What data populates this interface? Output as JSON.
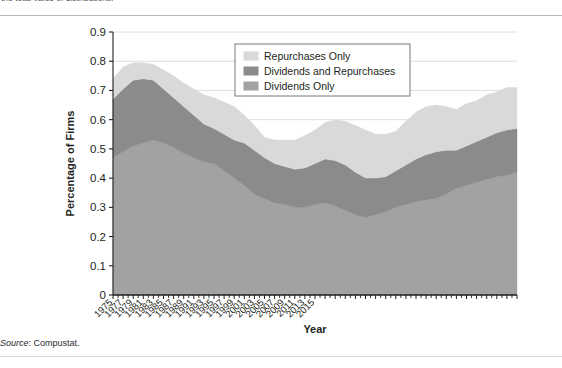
{
  "caption_fragment": "the total value of distributions.",
  "source_note": {
    "prefix": "Source",
    "text": ": Compustat."
  },
  "axis": {
    "ylabel": "Percentage of Firms",
    "xlabel": "Year",
    "yticks": [
      "0",
      "0.1",
      "0.2",
      "0.3",
      "0.4",
      "0.5",
      "0.6",
      "0.7",
      "0.8",
      "0.9"
    ],
    "xticks": [
      "1975",
      "1977",
      "1979",
      "1981",
      "1983",
      "1985",
      "1987",
      "1989",
      "1991",
      "1993",
      "1995",
      "1997",
      "1999",
      "2001",
      "2003",
      "2005",
      "2007",
      "2009",
      "2011",
      "2013",
      "2015"
    ]
  },
  "legend": {
    "items": [
      {
        "label": "Repurchases Only",
        "color": "#d9d9d9"
      },
      {
        "label": "Dividends and Repurchases",
        "color": "#8b8b8b"
      },
      {
        "label": "Dividends Only",
        "color": "#a2a2a2"
      }
    ]
  },
  "colors": {
    "repurchases_only": "#d9d9d9",
    "dividends_and_repurchases": "#8b8b8b",
    "dividends_only": "#a2a2a2",
    "axis": "#231f20",
    "grid": "#d5d5d7",
    "outline": "#bdbdbd"
  },
  "chart_data": {
    "type": "area",
    "stacked": true,
    "title": "",
    "xlabel": "Year",
    "ylabel": "Percentage of Firms",
    "xlim": [
      1975,
      2015
    ],
    "ylim": [
      0,
      0.9
    ],
    "grid": true,
    "legend_position": "top-center",
    "x": [
      1975,
      1976,
      1977,
      1978,
      1979,
      1980,
      1981,
      1982,
      1983,
      1984,
      1985,
      1986,
      1987,
      1988,
      1989,
      1990,
      1991,
      1992,
      1993,
      1994,
      1995,
      1996,
      1997,
      1998,
      1999,
      2000,
      2001,
      2002,
      2003,
      2004,
      2005,
      2006,
      2007,
      2008,
      2009,
      2010,
      2011,
      2012,
      2013,
      2014,
      2015
    ],
    "series": [
      {
        "name": "Dividends Only",
        "values": [
          0.47,
          0.49,
          0.51,
          0.52,
          0.53,
          0.52,
          0.505,
          0.485,
          0.47,
          0.455,
          0.45,
          0.425,
          0.4,
          0.375,
          0.345,
          0.33,
          0.315,
          0.31,
          0.3,
          0.3,
          0.31,
          0.315,
          0.305,
          0.29,
          0.275,
          0.265,
          0.275,
          0.285,
          0.3,
          0.31,
          0.32,
          0.325,
          0.33,
          0.345,
          0.365,
          0.375,
          0.385,
          0.395,
          0.405,
          0.41,
          0.42
        ]
      },
      {
        "name": "Dividends and Repurchases",
        "values": [
          0.2,
          0.215,
          0.225,
          0.22,
          0.205,
          0.185,
          0.17,
          0.16,
          0.145,
          0.13,
          0.12,
          0.125,
          0.13,
          0.145,
          0.15,
          0.14,
          0.135,
          0.13,
          0.13,
          0.135,
          0.14,
          0.15,
          0.155,
          0.155,
          0.145,
          0.135,
          0.125,
          0.12,
          0.125,
          0.135,
          0.145,
          0.155,
          0.16,
          0.15,
          0.13,
          0.135,
          0.14,
          0.145,
          0.15,
          0.155,
          0.15
        ]
      },
      {
        "name": "Repurchases Only",
        "values": [
          0.07,
          0.075,
          0.06,
          0.055,
          0.055,
          0.065,
          0.075,
          0.08,
          0.09,
          0.1,
          0.105,
          0.11,
          0.115,
          0.095,
          0.085,
          0.07,
          0.08,
          0.09,
          0.1,
          0.11,
          0.115,
          0.125,
          0.14,
          0.15,
          0.16,
          0.165,
          0.15,
          0.145,
          0.135,
          0.15,
          0.16,
          0.165,
          0.16,
          0.15,
          0.14,
          0.145,
          0.14,
          0.145,
          0.14,
          0.145,
          0.14
        ]
      }
    ],
    "stack_tops": {
      "dividends_only": [
        0.47,
        0.49,
        0.51,
        0.52,
        0.53,
        0.52,
        0.505,
        0.485,
        0.47,
        0.455,
        0.45,
        0.425,
        0.4,
        0.375,
        0.345,
        0.33,
        0.315,
        0.31,
        0.3,
        0.3,
        0.31,
        0.315,
        0.305,
        0.29,
        0.275,
        0.265,
        0.275,
        0.285,
        0.3,
        0.31,
        0.32,
        0.325,
        0.33,
        0.345,
        0.365,
        0.375,
        0.385,
        0.395,
        0.405,
        0.41,
        0.42
      ],
      "plus_div_and_rep": [
        0.67,
        0.705,
        0.735,
        0.74,
        0.735,
        0.705,
        0.675,
        0.645,
        0.615,
        0.585,
        0.57,
        0.55,
        0.53,
        0.52,
        0.495,
        0.47,
        0.45,
        0.44,
        0.43,
        0.435,
        0.45,
        0.465,
        0.46,
        0.445,
        0.42,
        0.4,
        0.4,
        0.405,
        0.425,
        0.445,
        0.465,
        0.48,
        0.49,
        0.495,
        0.495,
        0.51,
        0.525,
        0.54,
        0.555,
        0.565,
        0.57
      ],
      "total": [
        0.74,
        0.78,
        0.795,
        0.795,
        0.79,
        0.77,
        0.75,
        0.725,
        0.705,
        0.685,
        0.675,
        0.66,
        0.645,
        0.615,
        0.58,
        0.54,
        0.53,
        0.53,
        0.53,
        0.545,
        0.565,
        0.59,
        0.6,
        0.595,
        0.58,
        0.565,
        0.55,
        0.55,
        0.56,
        0.595,
        0.625,
        0.645,
        0.65,
        0.645,
        0.635,
        0.655,
        0.665,
        0.685,
        0.695,
        0.71,
        0.71
      ]
    }
  }
}
